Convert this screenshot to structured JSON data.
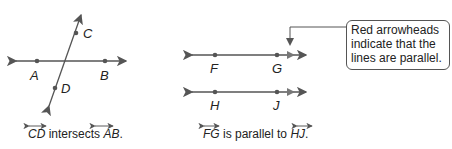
{
  "figure1": {
    "points": {
      "A": "A",
      "B": "B",
      "C": "C",
      "D": "D"
    },
    "caption": {
      "line1": "CD",
      "text": " intersects ",
      "line2": "AB",
      "end": "."
    }
  },
  "figure2": {
    "points": {
      "F": "F",
      "G": "G",
      "H": "H",
      "J": "J"
    },
    "caption": {
      "line1": "FG",
      "text": " is parallel to ",
      "line2": "HJ",
      "end": "."
    }
  },
  "callout": {
    "text": "Red arrowheads indicate that the lines are parallel."
  },
  "colors": {
    "line": "#555555",
    "arrow": "#777777"
  }
}
